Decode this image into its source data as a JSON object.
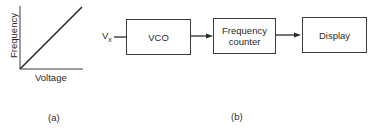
{
  "figure_a": {
    "y_axis_label": "Frequency",
    "x_axis_label": "Voltage",
    "caption": "(a)",
    "description": "Linear relationship: frequency increases proportionally with voltage"
  },
  "figure_b": {
    "input_label": "V",
    "input_subscript": "x",
    "blocks": [
      {
        "label": "VCO"
      },
      {
        "label_line1": "Frequency",
        "label_line2": "counter"
      },
      {
        "label": "Display"
      }
    ],
    "caption": "(b)"
  },
  "colors": {
    "line": "#2a2a2a",
    "background": "#ffffff"
  }
}
